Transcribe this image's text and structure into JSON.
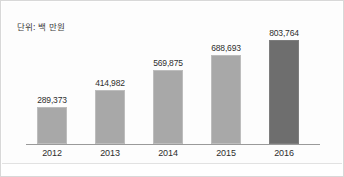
{
  "figure": {
    "unit_note": "단위: 백 만원",
    "background_color": "#ffffff",
    "border_color": "#d8d8d8",
    "bar_color": "#a8a8a8",
    "accent_bar_color": "#6e6e6e",
    "axis_color": "#9a9a9a"
  },
  "chart_data": {
    "type": "bar",
    "title": "",
    "subtitle": "",
    "xlabel": "",
    "ylabel": "",
    "annotations": [
      "단위: 백 만원"
    ],
    "grid": false,
    "legend": false,
    "legend_position": "none",
    "ylim": [
      0,
      880000
    ],
    "categories": [
      "2012",
      "2013",
      "2014",
      "2015",
      "2016"
    ],
    "values": [
      289373,
      414982,
      569875,
      688693,
      803764
    ],
    "value_labels": [
      "289,373",
      "414,982",
      "569,875",
      "688,693",
      "803,764"
    ],
    "highlight_index": 4,
    "series": [
      {
        "name": "",
        "values": [
          289373,
          414982,
          569875,
          688693,
          803764
        ]
      }
    ]
  }
}
